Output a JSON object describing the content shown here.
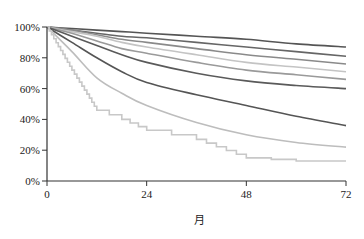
{
  "chart_data": {
    "type": "line",
    "title": "",
    "xlabel": "月",
    "ylabel": "",
    "xlim": [
      0,
      72
    ],
    "ylim": [
      0,
      100
    ],
    "x_ticks": [
      0,
      24,
      48,
      72
    ],
    "x_tick_labels": [
      "0",
      "24",
      "48",
      "72"
    ],
    "y_ticks": [
      0,
      20,
      40,
      60,
      80,
      100
    ],
    "y_tick_labels": [
      "0%",
      "20%",
      "40%",
      "60%",
      "80%",
      "100%"
    ],
    "grid": false,
    "legend": null,
    "x": [
      0,
      6,
      12,
      18,
      24,
      36,
      48,
      60,
      72
    ],
    "series": [
      {
        "name": "curve-1",
        "color": "#555555",
        "step": false,
        "values": [
          100,
          99,
          98,
          97,
          96,
          94,
          92,
          89,
          87
        ]
      },
      {
        "name": "curve-2",
        "color": "#666666",
        "step": false,
        "values": [
          100,
          98,
          96,
          94,
          93,
          90,
          87,
          84,
          81
        ]
      },
      {
        "name": "curve-3",
        "color": "#8a8a8a",
        "step": false,
        "values": [
          100,
          98,
          95,
          92,
          90,
          86,
          82,
          79,
          76
        ]
      },
      {
        "name": "curve-4",
        "color": "#c4c4c4",
        "step": false,
        "values": [
          100,
          97,
          94,
          90,
          87,
          82,
          77,
          74,
          71
        ]
      },
      {
        "name": "curve-5",
        "color": "#9a9a9a",
        "step": false,
        "values": [
          100,
          96,
          91,
          86,
          83,
          77,
          72,
          69,
          66
        ]
      },
      {
        "name": "curve-6",
        "color": "#5a5a5a",
        "step": false,
        "values": [
          100,
          94,
          88,
          82,
          77,
          70,
          65,
          62,
          60
        ]
      },
      {
        "name": "curve-7",
        "color": "#555555",
        "step": false,
        "values": [
          100,
          90,
          80,
          71,
          64,
          56,
          49,
          42,
          36
        ]
      },
      {
        "name": "curve-8",
        "color": "#bdbdbd",
        "step": false,
        "values": [
          100,
          84,
          67,
          57,
          49,
          38,
          30,
          25,
          22
        ]
      },
      {
        "name": "curve-9",
        "color": "#c8c8c8",
        "step": true,
        "values": [
          100,
          72,
          46,
          40,
          33,
          27,
          15,
          13,
          13
        ]
      }
    ]
  }
}
